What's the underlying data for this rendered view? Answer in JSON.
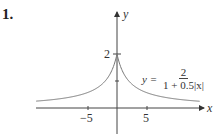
{
  "problem_number": "1.",
  "chart_data": {
    "type": "line",
    "title": "",
    "function": "y = 2 / (1 + 0.5|x|)",
    "xlabel": "x",
    "ylabel": "y",
    "xlim": [
      -14,
      14
    ],
    "ylim": [
      -0.9,
      2.9
    ],
    "x_ticks": [
      -5,
      5
    ],
    "x_tick_labels": [
      "−5",
      "5"
    ],
    "y_ticks": [
      1,
      2
    ],
    "y_tick_labels": [
      "",
      "2"
    ],
    "grid": false,
    "series": [
      {
        "name": "y = 2/(1+0.5|x|)",
        "x": [
          -14,
          -10,
          -8,
          -6,
          -5,
          -4,
          -3,
          -2,
          -1,
          0,
          1,
          2,
          3,
          4,
          5,
          6,
          8,
          10,
          14
        ],
        "values": [
          0.25,
          0.333,
          0.4,
          0.5,
          0.571,
          0.667,
          0.8,
          1.0,
          1.333,
          2.0,
          1.333,
          1.0,
          0.8,
          0.667,
          0.571,
          0.5,
          0.4,
          0.333,
          0.25
        ]
      }
    ],
    "annotations": [
      {
        "text": "y =",
        "numerator": "2",
        "denominator": "1 + 0.5|x|"
      }
    ]
  },
  "labels": {
    "y_axis": "y",
    "x_axis": "x",
    "y_tick_2": "2",
    "x_tick_neg5": "−5",
    "x_tick_5": "5",
    "eq_lhs": "y =",
    "eq_num": "2",
    "eq_den": "1 + 0.5|x|"
  },
  "colors": {
    "axis": "#444444",
    "curve": "#666666"
  }
}
